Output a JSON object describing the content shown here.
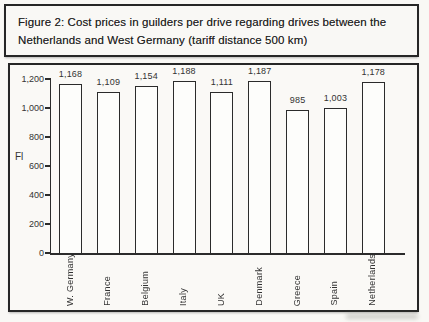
{
  "figure": {
    "title": "Figure 2: Cost prices in guilders per drive regarding drives between the Netherlands and West Germany (tariff distance 500 km)"
  },
  "chart_data": {
    "type": "bar",
    "categories": [
      "W. Germany",
      "France",
      "Belgium",
      "Italy",
      "UK",
      "Denmark",
      "Greece",
      "Spain",
      "Netherlands"
    ],
    "values": [
      1168,
      1109,
      1154,
      1188,
      1111,
      1187,
      985,
      1003,
      1178
    ],
    "value_labels": [
      "1,168",
      "1,109",
      "1,154",
      "1,188",
      "1,111",
      "1,187",
      "985",
      "1,003",
      "1,178"
    ],
    "title": "",
    "xlabel": "",
    "ylabel": "Fl",
    "ylim": [
      0,
      1200
    ],
    "yticks": [
      0,
      200,
      400,
      600,
      800,
      1000,
      1200
    ],
    "ytick_labels": [
      "0",
      "200",
      "400",
      "600",
      "800",
      "1,000",
      "1,200"
    ],
    "grid": false,
    "legend_position": "none",
    "bar_fill": "#fdfdfb",
    "ink_color": "#2b2b2b"
  },
  "colors": {
    "paper": "#f9f8f5",
    "border_ink": "#262626",
    "text_ink": "#333333"
  }
}
